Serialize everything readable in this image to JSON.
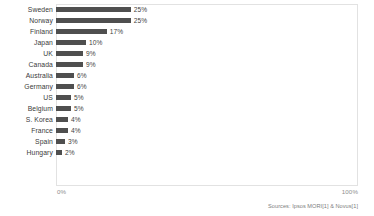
{
  "chart_data": {
    "type": "bar",
    "orientation": "horizontal",
    "title": "",
    "subtitle": "",
    "xlabel": "",
    "ylabel": "",
    "xlim": [
      0,
      100
    ],
    "grid": false,
    "legend": null,
    "bar_color": "#4f4f4f",
    "plot_border_color": "#e2e2e2",
    "background_color": "#ffffff",
    "categories": [
      "Sweden",
      "Norway",
      "Finland",
      "Japan",
      "UK",
      "Canada",
      "Australia",
      "Germany",
      "US",
      "Belgium",
      "S. Korea",
      "France",
      "Spain",
      "Hungary"
    ],
    "values": [
      25,
      25,
      17,
      10,
      9,
      9,
      6,
      6,
      5,
      5,
      4,
      4,
      3,
      2
    ],
    "data_labels": [
      "25%",
      "25%",
      "17%",
      "10%",
      "9%",
      "9%",
      "6%",
      "6%",
      "5%",
      "5%",
      "4%",
      "4%",
      "3%",
      "2%"
    ],
    "xticks": [
      0,
      100
    ],
    "xticklabels": [
      "0%",
      "100%"
    ],
    "annotations": [
      "Sources: Ipsos MORI[1] & Novus[1]"
    ]
  },
  "axis": {
    "min_label": "0%",
    "max_label": "100%"
  },
  "footer": {
    "source": "Sources: Ipsos MORI[1] & Novus[1]"
  }
}
